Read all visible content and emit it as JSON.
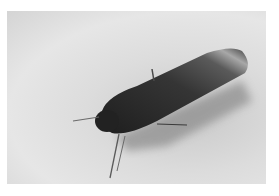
{
  "image": {
    "subject": "moth resting on fabric surface",
    "style": "grayscale photograph",
    "colors": {
      "background": "#dcdcdc",
      "moth_body": "#2a2a2a",
      "wing_tip": "#9a9a9a",
      "shadow": "#8c8c8c"
    }
  }
}
